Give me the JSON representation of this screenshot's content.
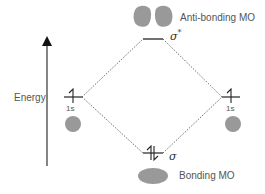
{
  "diagram": {
    "axis_label": "Energy",
    "antibonding": {
      "symbol": "σ",
      "superscript": "*",
      "label": "Anti-bonding MO"
    },
    "bonding": {
      "symbol": "σ",
      "label": "Bonding MO"
    },
    "left_atom": {
      "orbital": "1s"
    },
    "right_atom": {
      "orbital": "1s"
    },
    "colors": {
      "lobe": "#999999",
      "line": "#222222",
      "dotted": "#444444"
    }
  }
}
